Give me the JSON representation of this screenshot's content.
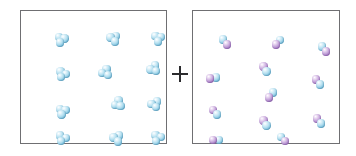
{
  "figure": {
    "title": "",
    "background_color": "#ffffff",
    "width": 356,
    "height": 156,
    "operator_label": "+",
    "operator_icon": "plus-icon"
  },
  "palette": {
    "blue_atom": "#7ec3e0",
    "purple_atom": "#a87fc6",
    "box_border": "#6f6f72",
    "operator_color": "#2b2b2e",
    "background": "#ffffff"
  },
  "boxes": [
    {
      "id": "reactant-a",
      "name": "triatomic-sample-box",
      "x": 20,
      "y": 10,
      "width": 147,
      "height": 134,
      "molecule_count": 12,
      "atoms_per_molecule": 3,
      "atom_colors": [
        "blue",
        "blue",
        "blue"
      ],
      "molecules": [
        {
          "cx": 40,
          "cy": 29,
          "rot": 18
        },
        {
          "cx": 92,
          "cy": 27,
          "rot": 104
        },
        {
          "cx": 137,
          "cy": 28,
          "rot": 8
        },
        {
          "cx": 41,
          "cy": 64,
          "rot": 26
        },
        {
          "cx": 85,
          "cy": 62,
          "rot": 318
        },
        {
          "cx": 133,
          "cy": 57,
          "rot": 196
        },
        {
          "cx": 41,
          "cy": 101,
          "rot": 14
        },
        {
          "cx": 97,
          "cy": 92,
          "rot": 188
        },
        {
          "cx": 133,
          "cy": 93,
          "rot": 98
        },
        {
          "cx": 41,
          "cy": 128,
          "rot": 22
        },
        {
          "cx": 95,
          "cy": 127,
          "rot": 100
        },
        {
          "cx": 136,
          "cy": 126,
          "rot": 140
        }
      ]
    },
    {
      "id": "reactant-b",
      "name": "diatomic-sample-box",
      "x": 192,
      "y": 10,
      "width": 148,
      "height": 134,
      "molecule_count": 12,
      "atoms_per_molecule": 2,
      "atom_colors": [
        "blue",
        "purple"
      ],
      "molecules": [
        {
          "cx": 32,
          "cy": 31,
          "rot": 56
        },
        {
          "cx": 85,
          "cy": 31,
          "rot": 128
        },
        {
          "cx": 131,
          "cy": 38,
          "rot": 56
        },
        {
          "cx": 20,
          "cy": 67,
          "rot": 172
        },
        {
          "cx": 72,
          "cy": 58,
          "rot": 238
        },
        {
          "cx": 125,
          "cy": 71,
          "rot": 236
        },
        {
          "cx": 22,
          "cy": 101,
          "rot": 232
        },
        {
          "cx": 78,
          "cy": 84,
          "rot": 126
        },
        {
          "cx": 72,
          "cy": 112,
          "rot": 238
        },
        {
          "cx": 126,
          "cy": 110,
          "rot": 236
        },
        {
          "cx": 23,
          "cy": 129,
          "rot": 174
        },
        {
          "cx": 90,
          "cy": 128,
          "rot": 48
        }
      ]
    }
  ],
  "legend": {
    "blue_atom_label": "",
    "purple_atom_label": ""
  }
}
